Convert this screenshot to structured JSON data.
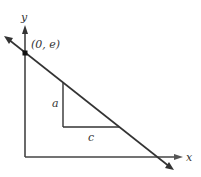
{
  "diagram": {
    "axes": {
      "x_label": "x",
      "y_label": "y"
    },
    "point": {
      "label": "(0, e)"
    },
    "triangle": {
      "vertical_label": "a",
      "horizontal_label": "c"
    },
    "colors": {
      "stroke": "#3a3a3a",
      "axis": "#444444",
      "background": "#ffffff"
    }
  }
}
